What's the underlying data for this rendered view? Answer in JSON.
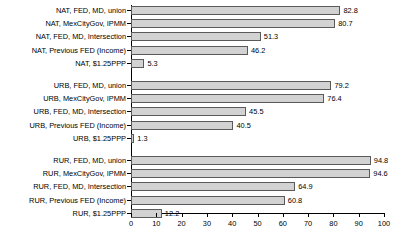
{
  "chart_data": {
    "type": "bar",
    "orientation": "horizontal",
    "title": "",
    "subtitle": "",
    "xlabel": "",
    "ylabel": "",
    "xlim": [
      0,
      100
    ],
    "ylim": null,
    "grid": false,
    "legend": null,
    "xticks": [
      0,
      10,
      20,
      30,
      40,
      50,
      60,
      70,
      80,
      90,
      100
    ],
    "xtick_labels": [
      "0",
      "10",
      "20",
      "30",
      "40",
      "50",
      "60",
      "70",
      "80",
      "90",
      "100"
    ],
    "bar_fill_color": "#d2d2d2",
    "bar_border_color": "#5a5a5a",
    "background_color": "#ffffff",
    "categories": [
      "NAT, FED, MD, union",
      "NAT, MexCityGov, IPMM",
      "NAT, FED, MD, Intersection",
      "NAT, Previous FED (Income)",
      "NAT, $1.25PPP",
      "URB, FED, MD, union",
      "URB, MexCityGov, IPMM",
      "URB, FED, MD, Intersection",
      "URB, Previous FED (Income)",
      "URB, $1.25PPP",
      "RUR, FED, MD, union",
      "RUR, MexCityGov, IPMM",
      "RUR, FED, MD, Intersection",
      "RUR, Previous FED (Income)",
      "RUR, $1.25PPP"
    ],
    "values": [
      82.8,
      80.7,
      51.3,
      46.2,
      5.3,
      79.2,
      76.4,
      45.5,
      40.5,
      1.3,
      94.8,
      94.6,
      64.9,
      60.8,
      12.2
    ],
    "value_labels": [
      "82.8",
      "80.7",
      "51.3",
      "46.2",
      "5.3",
      "79.2",
      "76.4",
      "45.5",
      "40.5",
      "1.3",
      "94.8",
      "94.6",
      "64.9",
      "60.8",
      "12.2"
    ],
    "groups": [
      {
        "name": "NAT",
        "indices": [
          0,
          1,
          2,
          3,
          4
        ]
      },
      {
        "name": "URB",
        "indices": [
          5,
          6,
          7,
          8,
          9
        ]
      },
      {
        "name": "RUR",
        "indices": [
          10,
          11,
          12,
          13,
          14
        ]
      }
    ]
  }
}
